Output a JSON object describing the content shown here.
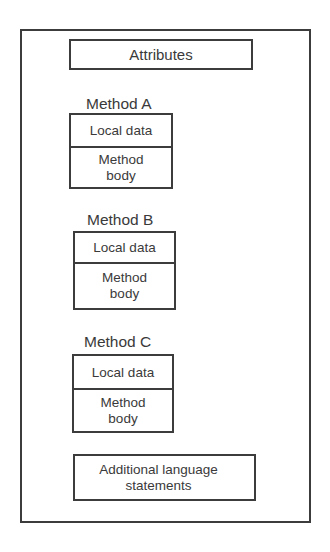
{
  "diagram": {
    "attributes_label": "Attributes",
    "methods": [
      {
        "title": "Method A",
        "local_data": "Local data",
        "body": "Method\nbody"
      },
      {
        "title": "Method B",
        "local_data": "Local data",
        "body": "Method\nbody"
      },
      {
        "title": "Method C",
        "local_data": "Local data",
        "body": "Method\nbody"
      }
    ],
    "additional_label": "Additional language\nstatements",
    "colors": {
      "line": "#3c3c3c",
      "text": "#3a3a3a",
      "background": "#ffffff"
    }
  }
}
